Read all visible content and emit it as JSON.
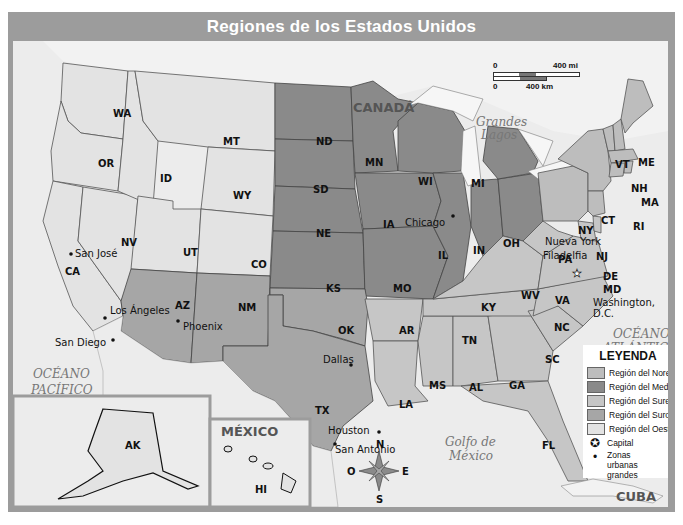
{
  "title": "Regiones de los Estados Unidos",
  "labels": {
    "canada": "CANADÁ",
    "mexico": "MÉXICO",
    "cuba": "CUBA",
    "pacific_1": "OCÉANO",
    "pacific_2": "PACÍFICO",
    "atlantic_1": "OCÉANO",
    "atlantic_2": "ATLÁNTICO",
    "gulf_1": "Golfo de",
    "gulf_2": "México",
    "great_lakes_1": "Grandes",
    "great_lakes_2": "Lagos"
  },
  "scale_bar": {
    "mi_start": "0",
    "mi_end": "400 mi",
    "km_start": "0",
    "km_end": "400 km"
  },
  "compass": {
    "n": "N",
    "s": "S",
    "e": "E",
    "w": "O"
  },
  "legend": {
    "title": "LEYENDA",
    "items": [
      {
        "label": "Región del Noreste",
        "color": "#bdbdbd"
      },
      {
        "label": "Región del Medio Oeste",
        "color": "#8a8a8a"
      },
      {
        "label": "Región del Sureste",
        "color": "#c6c6c6"
      },
      {
        "label": "Región del Suroeste",
        "color": "#a6a6a6"
      },
      {
        "label": "Región del Oeste",
        "color": "#e3e3e3"
      }
    ],
    "capital": "Capital",
    "urban": "Zonas urbanas grandes"
  },
  "states": {
    "west": [
      "WA",
      "OR",
      "CA",
      "NV",
      "ID",
      "MT",
      "WY",
      "UT",
      "CO",
      "AK",
      "HI"
    ],
    "midwest": [
      "ND",
      "SD",
      "NE",
      "KS",
      "MN",
      "IA",
      "MO",
      "WI",
      "IL",
      "MI",
      "IN",
      "OH"
    ],
    "southwest": [
      "AZ",
      "NM",
      "TX",
      "OK"
    ],
    "southeast": [
      "AR",
      "LA",
      "MS",
      "AL",
      "GA",
      "FL",
      "TN",
      "KY",
      "SC",
      "NC",
      "VA",
      "WV",
      "DE",
      "MD"
    ],
    "northeast": [
      "ME",
      "VT",
      "NH",
      "MA",
      "RI",
      "CT",
      "NY",
      "PA",
      "NJ"
    ]
  },
  "cities": {
    "san_jose": "San José",
    "los_angeles": "Los Ángeles",
    "san_diego": "San Diego",
    "phoenix": "Phoenix",
    "dallas": "Dallas",
    "houston": "Houston",
    "san_antonio": "San Antonio",
    "chicago": "Chicago",
    "nueva_york": "Nueva York",
    "filadelfia": "Filadelfia",
    "washington_1": "Washington,",
    "washington_2": "D.C."
  },
  "state_labels": {
    "WA": "WA",
    "OR": "OR",
    "CA": "CA",
    "NV": "NV",
    "ID": "ID",
    "MT": "MT",
    "WY": "WY",
    "UT": "UT",
    "CO": "CO",
    "AZ": "AZ",
    "NM": "NM",
    "ND": "ND",
    "SD": "SD",
    "NE": "NE",
    "KS": "KS",
    "MN": "MN",
    "IA": "IA",
    "MO": "MO",
    "WI": "WI",
    "IL": "IL",
    "MI": "MI",
    "IN": "IN",
    "OH": "OH",
    "OK": "OK",
    "TX": "TX",
    "AR": "AR",
    "LA": "LA",
    "MS": "MS",
    "AL": "AL",
    "GA": "GA",
    "FL": "FL",
    "TN": "TN",
    "KY": "KY",
    "SC": "SC",
    "NC": "NC",
    "VA": "VA",
    "WV": "WV",
    "PA": "PA",
    "NY": "NY",
    "VT": "VT",
    "ME": "ME",
    "NH": "NH",
    "MA": "MA",
    "RI": "RI",
    "CT": "CT",
    "NJ": "NJ",
    "DE": "DE",
    "MD": "MD",
    "AK": "AK",
    "HI": "HI"
  },
  "colors": {
    "title_bar": "#9c9c9c",
    "water": "#ececec",
    "west": "#e3e3e3",
    "midwest": "#8a8a8a",
    "southwest": "#a6a6a6",
    "southeast": "#c6c6c6",
    "northeast": "#bdbdbd"
  }
}
